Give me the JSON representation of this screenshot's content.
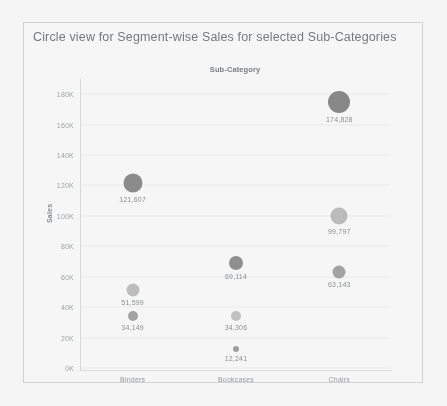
{
  "chart_data": {
    "type": "scatter",
    "title": "Circle view for Segment-wise Sales for selected Sub-Categories",
    "legend_header": "Sub-Category",
    "xlabel": "",
    "ylabel": "Sales",
    "categories": [
      "Binders",
      "Bookcases",
      "Chairs"
    ],
    "ylim": [
      0,
      190000
    ],
    "yticks": [
      {
        "value": 0,
        "label": "0K"
      },
      {
        "value": 20000,
        "label": "20K"
      },
      {
        "value": 40000,
        "label": "40K"
      },
      {
        "value": 60000,
        "label": "60K"
      },
      {
        "value": 80000,
        "label": "80K"
      },
      {
        "value": 100000,
        "label": "100K"
      },
      {
        "value": 120000,
        "label": "120K"
      },
      {
        "value": 140000,
        "label": "140K"
      },
      {
        "value": 160000,
        "label": "160K"
      },
      {
        "value": 180000,
        "label": "180K"
      }
    ],
    "grid": true,
    "legend_position": "top-center",
    "points": [
      {
        "category": "Binders",
        "value": 121607,
        "label": "121,607",
        "size": 19,
        "color": "#848484"
      },
      {
        "category": "Binders",
        "value": 51599,
        "label": "51,599",
        "size": 13,
        "color": "#bdbdbd"
      },
      {
        "category": "Binders",
        "value": 34149,
        "label": "34,149",
        "size": 10,
        "color": "#9e9e9e"
      },
      {
        "category": "Bookcases",
        "value": 69114,
        "label": "69,114",
        "size": 14,
        "color": "#8a8a8a"
      },
      {
        "category": "Bookcases",
        "value": 34306,
        "label": "34,306",
        "size": 10,
        "color": "#c2c2c2"
      },
      {
        "category": "Bookcases",
        "value": 12241,
        "label": "12,241",
        "size": 6,
        "color": "#9c9c9c"
      },
      {
        "category": "Chairs",
        "value": 174828,
        "label": "174,828",
        "size": 22,
        "color": "#808080"
      },
      {
        "category": "Chairs",
        "value": 99797,
        "label": "99,797",
        "size": 17,
        "color": "#bbbbbb"
      },
      {
        "category": "Chairs",
        "value": 63143,
        "label": "63,143",
        "size": 13,
        "color": "#a0a0a0"
      }
    ]
  }
}
